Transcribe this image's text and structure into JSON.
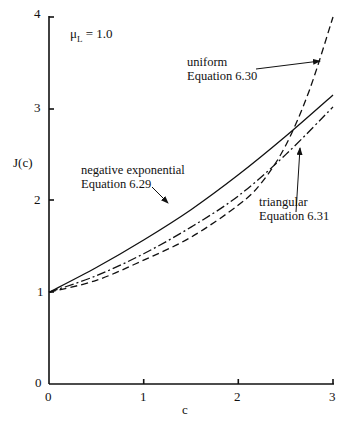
{
  "chart_data": {
    "type": "line",
    "title": "",
    "xlabel": "c",
    "ylabel": "J(c)",
    "xlim": [
      0,
      3
    ],
    "ylim": [
      0,
      4
    ],
    "grid": false,
    "x_ticks": [
      "0",
      "1",
      "2",
      "3"
    ],
    "y_ticks": [
      "0",
      "1",
      "2",
      "3",
      "4"
    ],
    "parameter_annotation": "μL = 1.0",
    "series": [
      {
        "name": "negative exponential",
        "equation": "Equation 6.29",
        "style": "solid",
        "x": [
          0,
          0.5,
          1,
          1.5,
          2,
          2.5,
          3
        ],
        "values": [
          1.0,
          1.27,
          1.57,
          1.9,
          2.28,
          2.7,
          3.15
        ]
      },
      {
        "name": "uniform",
        "equation": "Equation 6.30",
        "style": "dashed",
        "x": [
          0,
          0.5,
          1,
          1.5,
          2,
          2.25,
          2.5,
          2.75,
          3
        ],
        "values": [
          1.0,
          1.13,
          1.35,
          1.6,
          1.95,
          2.2,
          2.6,
          3.2,
          4.0
        ]
      },
      {
        "name": "triangular",
        "equation": "Equation 6.31",
        "style": "dash-dot",
        "x": [
          0,
          0.5,
          1,
          1.5,
          2,
          2.5,
          3
        ],
        "values": [
          1.0,
          1.18,
          1.42,
          1.71,
          2.05,
          2.5,
          3.02
        ]
      }
    ]
  },
  "labels": {
    "mu": "μ",
    "mu_sub": "L",
    "mu_value": " = 1.0",
    "ylabel": "J(c)",
    "xlabel": "c",
    "neg_exp_line1": "negative exponential",
    "neg_exp_line2": "Equation 6.29",
    "uniform_line1": "uniform",
    "uniform_line2": "Equation 6.30",
    "triangular_line1": "triangular",
    "triangular_line2": "Equation 6.31"
  },
  "ticks": {
    "x": [
      "0",
      "1",
      "2",
      "3"
    ],
    "y": [
      "0",
      "1",
      "2",
      "3",
      "4"
    ]
  }
}
